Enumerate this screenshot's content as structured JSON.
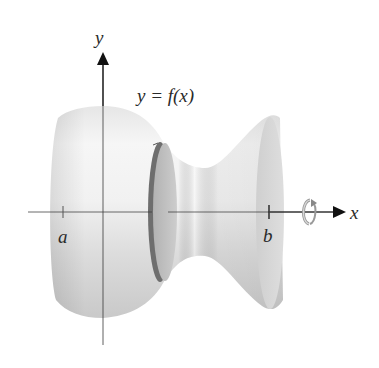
{
  "figure": {
    "type": "solid-of-revolution-diagram"
  },
  "labels": {
    "y_axis": "y",
    "x_axis": "x",
    "function": "y = f(x)",
    "left_bound": "a",
    "right_bound": "b"
  },
  "icons": {
    "rotation": "rotation-arrow-icon",
    "axis_arrow_x": "arrowhead-right-icon",
    "axis_arrow_y": "arrowhead-up-icon"
  },
  "colors": {
    "axis": "#3a3a3a",
    "solid_light": "#f2f2f2",
    "solid_mid": "#d9d9d9",
    "solid_dark": "#bdbdbd",
    "disk_face": "#bfbfbf",
    "disk_rim": "#6e6e6e",
    "end_face": "#d4d4d4",
    "text": "#2a2a2a"
  }
}
